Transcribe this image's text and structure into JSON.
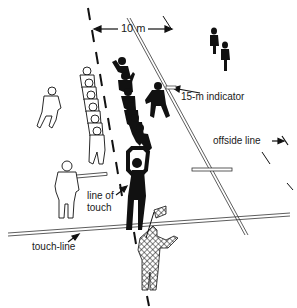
{
  "diagram": {
    "labels": {
      "distance": "10 m",
      "indicator": "15-m indicator",
      "offside": "offside line",
      "line_of_touch_1": "line of",
      "line_of_touch_2": "touch",
      "touch_line": "touch-line"
    },
    "figures": {
      "black_team_count": 8,
      "white_team_count": 8,
      "white_outliers": 2,
      "black_distant": 2,
      "thrower": "black figure arms raised",
      "touch_judge": "checked figure with flag"
    },
    "colors": {
      "ink": "#111111",
      "paper": "#ffffff"
    }
  }
}
